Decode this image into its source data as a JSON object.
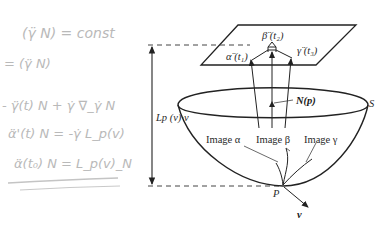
{
  "handwritten_notes": [
    "(γ̈ N) = const",
    "= (γ̈ N)",
    "- γ̈(t) N + γ̇ ∇_γ̇ N",
    "α̈'(t) N = -γ̇ L_p(v)",
    "α̈(t₀) N = L_p(v)_N"
  ],
  "diagram": {
    "plane_labels": {
      "alpha": "α̈ (t₁)",
      "beta": "β̈ (t₂)",
      "gamma": "γ̈ (t₃)"
    },
    "normal_label": "N(p)",
    "surface_label": "S",
    "height_label": "Lp (v)·v",
    "point_label": "P",
    "vector_label": "v",
    "curve_labels": {
      "alpha": "Image α",
      "beta": "Image β",
      "gamma": "Image γ"
    }
  },
  "colors": {
    "ink": "#222222",
    "handwriting": "#bbbbbb",
    "background": "#ffffff"
  }
}
